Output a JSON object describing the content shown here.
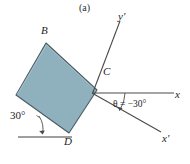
{
  "figure": {
    "subfigure_label": "(a)",
    "background_color": "#ffffff",
    "block": {
      "name": "square-block",
      "fill_color": "#8fb0bd",
      "stroke_color": "#4d5b63",
      "vertices": [
        {
          "label": "A",
          "x": 16,
          "y": 95,
          "shown": false
        },
        {
          "label": "B",
          "x": 46,
          "y": 43,
          "shown": true
        },
        {
          "label": "C",
          "x": 97,
          "y": 90,
          "shown": true
        },
        {
          "label": "D",
          "x": 69,
          "y": 133,
          "shown": true
        }
      ]
    },
    "vertex_labels": {
      "B": "B",
      "C": "C",
      "D": "D"
    },
    "axes": [
      {
        "name": "x-axis",
        "label": "x",
        "from": {
          "x": 93,
          "y": 93
        },
        "to": {
          "x": 174,
          "y": 93
        },
        "color": "#4a4a4a",
        "arrow": false
      },
      {
        "name": "x-prime-axis",
        "label": "x'",
        "from": {
          "x": 93,
          "y": 93
        },
        "to": {
          "x": 161,
          "y": 132
        },
        "color": "#4a4a4a",
        "arrow": false
      },
      {
        "name": "y-prime-axis",
        "label": "y'",
        "from": {
          "x": 93,
          "y": 93
        },
        "to": {
          "x": 120,
          "y": 21
        },
        "color": "#4a4a4a",
        "arrow": false
      }
    ],
    "angles": [
      {
        "name": "theta-angle",
        "label_prefix": "θ",
        "label_value": " = −30°",
        "text": "θ = −30°",
        "value_degrees": -30,
        "between": [
          "x-axis",
          "x-prime-axis"
        ],
        "arc_radius": 30
      },
      {
        "name": "base-angle-30",
        "text": "30°",
        "value_degrees": 30,
        "between": [
          "block-edge-AD",
          "horizontal-reference"
        ],
        "arc_radius": 22
      }
    ],
    "reference_line": {
      "name": "horizontal-reference-line",
      "from": {
        "x": 18,
        "y": 137
      },
      "to": {
        "x": 72,
        "y": 137
      },
      "color": "#3f3f3f"
    }
  }
}
